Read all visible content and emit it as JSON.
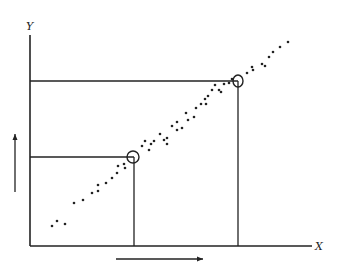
{
  "diagram": {
    "axes": {
      "x_label": "X",
      "y_label": "Y",
      "origin": [
        30,
        246
      ],
      "x_end": 312,
      "y_top": 35
    },
    "line_color": "#222222",
    "points": [
      [
        52,
        226
      ],
      [
        57,
        221
      ],
      [
        65,
        224
      ],
      [
        74,
        203
      ],
      [
        83,
        200
      ],
      [
        92,
        193
      ],
      [
        98,
        191
      ],
      [
        98,
        185
      ],
      [
        106,
        183
      ],
      [
        112,
        178
      ],
      [
        117,
        173
      ],
      [
        118,
        166
      ],
      [
        125,
        168
      ],
      [
        124,
        164
      ],
      [
        142,
        146
      ],
      [
        145,
        141
      ],
      [
        149,
        150
      ],
      [
        151,
        144
      ],
      [
        154,
        141
      ],
      [
        160,
        134
      ],
      [
        164,
        140
      ],
      [
        167,
        138
      ],
      [
        167,
        144
      ],
      [
        172,
        126
      ],
      [
        177,
        130
      ],
      [
        177,
        122
      ],
      [
        182,
        128
      ],
      [
        186,
        113
      ],
      [
        188,
        120
      ],
      [
        194,
        117
      ],
      [
        196,
        108
      ],
      [
        201,
        104
      ],
      [
        205,
        99
      ],
      [
        208,
        96
      ],
      [
        206,
        104
      ],
      [
        212,
        90
      ],
      [
        215,
        85
      ],
      [
        219,
        90
      ],
      [
        221,
        92
      ],
      [
        224,
        84
      ],
      [
        229,
        83
      ],
      [
        232,
        79
      ],
      [
        247,
        73
      ],
      [
        252,
        67
      ],
      [
        253,
        70
      ],
      [
        262,
        64
      ],
      [
        265,
        66
      ],
      [
        269,
        57
      ],
      [
        273,
        52
      ],
      [
        280,
        47
      ],
      [
        288,
        42
      ]
    ],
    "reference_lines": [
      {
        "name": "upper",
        "x": 238,
        "y": 81
      },
      {
        "name": "lower",
        "x": 134,
        "y": 157
      }
    ],
    "circles": [
      {
        "name": "lower-marked-point",
        "cx": 133,
        "cy": 157,
        "rx": 6,
        "ry": 6
      },
      {
        "name": "upper-marked-point",
        "cx": 238,
        "cy": 81,
        "rx": 5,
        "ry": 6
      }
    ],
    "arrows": [
      {
        "name": "y-increase-arrow",
        "x1": 15,
        "y1": 192,
        "x2": 15,
        "y2": 134
      },
      {
        "name": "x-increase-arrow",
        "x1": 116,
        "y1": 259,
        "x2": 203,
        "y2": 259
      }
    ]
  }
}
